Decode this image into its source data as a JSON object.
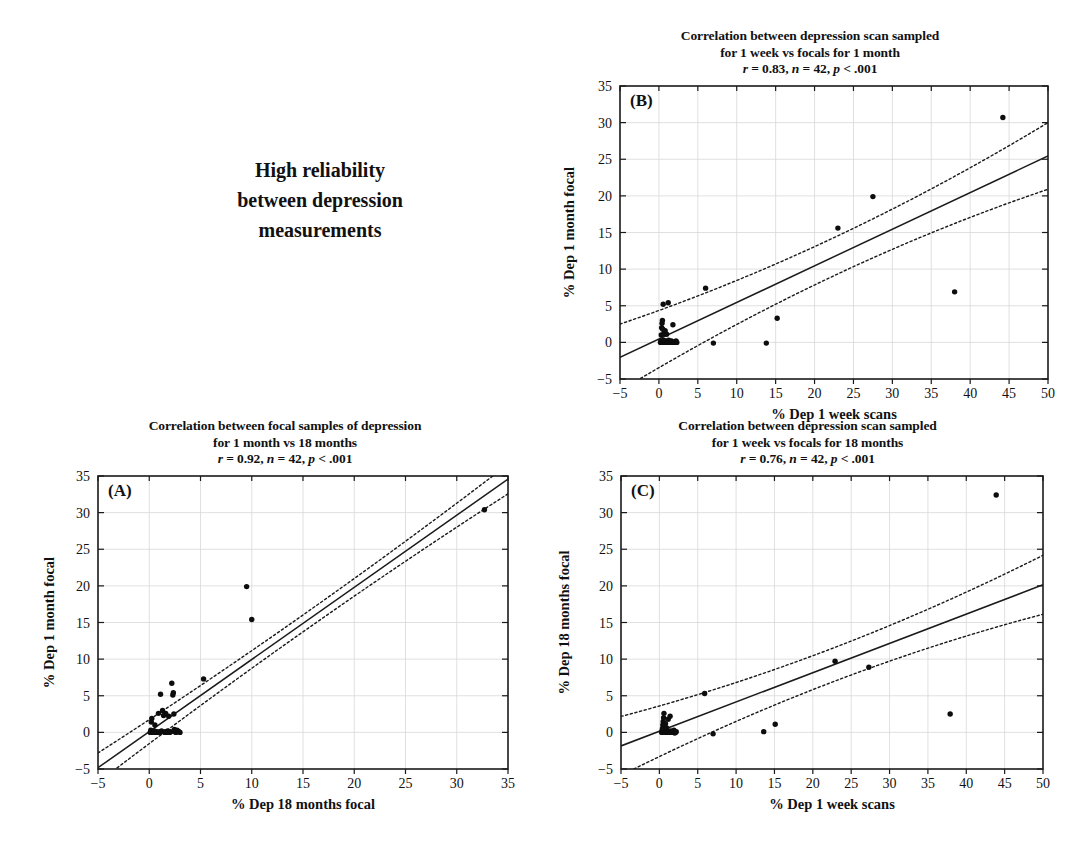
{
  "caption": {
    "lines": [
      "High reliability",
      "between depression",
      "measurements"
    ]
  },
  "chart_data": [
    {
      "id": "A",
      "panel_label": "(A)",
      "type": "scatter",
      "title_lines": [
        "Correlation between focal samples of depression",
        "for 1 month vs 18 months"
      ],
      "stats": {
        "r": "0.92",
        "n": "42",
        "p": "< .001",
        "text": "r = 0.92, n = 42, p < .001"
      },
      "xlabel": "% Dep 18 months focal",
      "ylabel": "% Dep 1 month focal",
      "xlim": [
        -5,
        35
      ],
      "ylim": [
        -5,
        35
      ],
      "xticks": [
        -5,
        0,
        5,
        10,
        15,
        20,
        25,
        30,
        35
      ],
      "yticks": [
        -5,
        0,
        5,
        10,
        15,
        20,
        25,
        30,
        35
      ],
      "xticklabels": [
        "−5",
        "0",
        "5",
        "10",
        "15",
        "20",
        "25",
        "30",
        "35"
      ],
      "yticklabels": [
        "−5",
        "0",
        "5",
        "10",
        "15",
        "20",
        "25",
        "30",
        "35"
      ],
      "grid": true,
      "fit": {
        "slope": 0.985,
        "intercept": 0.1
      },
      "ci_offset": 1.15,
      "points": [
        [
          0.1,
          0.0
        ],
        [
          0.15,
          0.3
        ],
        [
          0.2,
          1.4
        ],
        [
          0.25,
          1.9
        ],
        [
          0.3,
          0.0
        ],
        [
          0.35,
          0.1
        ],
        [
          0.4,
          0.0
        ],
        [
          0.5,
          0.2
        ],
        [
          0.55,
          1.0
        ],
        [
          0.6,
          0.0
        ],
        [
          0.7,
          0.1
        ],
        [
          0.8,
          0.0
        ],
        [
          0.9,
          2.6
        ],
        [
          1.0,
          0.1
        ],
        [
          1.05,
          0.0
        ],
        [
          1.1,
          5.2
        ],
        [
          1.2,
          0.2
        ],
        [
          1.3,
          3.0
        ],
        [
          1.4,
          2.3
        ],
        [
          1.5,
          0.0
        ],
        [
          1.55,
          0.1
        ],
        [
          1.6,
          2.6
        ],
        [
          1.7,
          0.0
        ],
        [
          1.8,
          0.2
        ],
        [
          1.9,
          2.2
        ],
        [
          2.0,
          0.0
        ],
        [
          2.1,
          0.1
        ],
        [
          2.2,
          6.7
        ],
        [
          2.3,
          5.1
        ],
        [
          2.35,
          5.4
        ],
        [
          2.4,
          2.5
        ],
        [
          2.5,
          0.1
        ],
        [
          2.6,
          0.0
        ],
        [
          2.7,
          0.3
        ],
        [
          2.8,
          0.2
        ],
        [
          2.9,
          0.1
        ],
        [
          3.0,
          0.0
        ],
        [
          5.3,
          7.3
        ],
        [
          9.5,
          19.9
        ],
        [
          10.0,
          15.4
        ],
        [
          32.7,
          30.4
        ],
        [
          2.45,
          0.4
        ]
      ]
    },
    {
      "id": "B",
      "panel_label": "(B)",
      "type": "scatter",
      "title_lines": [
        "Correlation between depression scan sampled",
        "for 1 week vs focals for 1 month"
      ],
      "stats": {
        "r": "0.83",
        "n": "42",
        "p": "< .001",
        "text": "r = 0.83, n = 42, p < .001"
      },
      "xlabel": "% Dep 1 week scans",
      "ylabel": "% Dep 1 month focal",
      "xlim": [
        -5,
        50
      ],
      "ylim": [
        -5,
        35
      ],
      "xticks": [
        -5,
        0,
        5,
        10,
        15,
        20,
        25,
        30,
        35,
        40,
        45,
        50
      ],
      "yticks": [
        -5,
        0,
        5,
        10,
        15,
        20,
        25,
        30,
        35
      ],
      "xticklabels": [
        "−5",
        "0",
        "5",
        "10",
        "15",
        "20",
        "25",
        "30",
        "35",
        "40",
        "45",
        "50"
      ],
      "yticklabels": [
        "−5",
        "0",
        "5",
        "10",
        "15",
        "20",
        "25",
        "30",
        "35"
      ],
      "grid": true,
      "fit": {
        "slope": 0.5,
        "intercept": 0.45
      },
      "ci_offset": 2.6,
      "points": [
        [
          0.2,
          0.0
        ],
        [
          0.25,
          0.2
        ],
        [
          0.3,
          1.0
        ],
        [
          0.35,
          2.0
        ],
        [
          0.4,
          2.6
        ],
        [
          0.45,
          0.1
        ],
        [
          0.5,
          0.0
        ],
        [
          0.55,
          5.2
        ],
        [
          0.6,
          0.3
        ],
        [
          0.65,
          1.2
        ],
        [
          0.7,
          0.0
        ],
        [
          0.75,
          0.1
        ],
        [
          0.8,
          1.6
        ],
        [
          0.85,
          0.0
        ],
        [
          0.9,
          0.2
        ],
        [
          0.95,
          0.0
        ],
        [
          1.0,
          1.1
        ],
        [
          1.05,
          0.0
        ],
        [
          1.1,
          0.1
        ],
        [
          1.15,
          0.0
        ],
        [
          1.2,
          5.4
        ],
        [
          1.25,
          0.3
        ],
        [
          1.3,
          0.0
        ],
        [
          1.4,
          0.1
        ],
        [
          1.5,
          0.0
        ],
        [
          1.6,
          0.2
        ],
        [
          1.7,
          0.0
        ],
        [
          1.8,
          2.4
        ],
        [
          1.9,
          0.0
        ],
        [
          2.0,
          0.1
        ],
        [
          2.1,
          0.0
        ],
        [
          2.2,
          0.2
        ],
        [
          2.3,
          0.0
        ],
        [
          0.45,
          3.0
        ],
        [
          0.5,
          1.8
        ],
        [
          6.0,
          7.4
        ],
        [
          7.0,
          -0.1
        ],
        [
          13.8,
          -0.1
        ],
        [
          15.2,
          3.3
        ],
        [
          23.0,
          15.6
        ],
        [
          27.5,
          19.9
        ],
        [
          38.0,
          6.9
        ],
        [
          44.2,
          30.7
        ]
      ]
    },
    {
      "id": "C",
      "panel_label": "(C)",
      "type": "scatter",
      "title_lines": [
        "Correlation between depression scan sampled",
        "for 1 week vs focals for 18 months"
      ],
      "stats": {
        "r": "0.76",
        "n": "42",
        "p": "< .001",
        "text": "r = 0.76, n = 42, p < .001"
      },
      "xlabel": "% Dep 1 week scans",
      "ylabel": "% Dep 18 months focal",
      "xlim": [
        -5,
        50
      ],
      "ylim": [
        -5,
        35
      ],
      "xticks": [
        -5,
        0,
        5,
        10,
        15,
        20,
        25,
        30,
        35,
        40,
        45,
        50
      ],
      "yticks": [
        -5,
        0,
        5,
        10,
        15,
        20,
        25,
        30,
        35
      ],
      "xticklabels": [
        "−5",
        "0",
        "5",
        "10",
        "15",
        "20",
        "25",
        "30",
        "35",
        "40",
        "45",
        "50"
      ],
      "yticklabels": [
        "−5",
        "0",
        "5",
        "10",
        "15",
        "20",
        "25",
        "30",
        "35"
      ],
      "grid": true,
      "fit": {
        "slope": 0.4,
        "intercept": 0.15
      },
      "ci_offset": 2.3,
      "points": [
        [
          0.3,
          0.0
        ],
        [
          0.35,
          0.2
        ],
        [
          0.4,
          0.5
        ],
        [
          0.45,
          1.0
        ],
        [
          0.5,
          1.5
        ],
        [
          0.55,
          2.0
        ],
        [
          0.6,
          2.6
        ],
        [
          0.62,
          0.1
        ],
        [
          0.65,
          0.0
        ],
        [
          0.7,
          0.3
        ],
        [
          0.72,
          0.8
        ],
        [
          0.75,
          0.0
        ],
        [
          0.8,
          1.2
        ],
        [
          0.85,
          0.0
        ],
        [
          0.9,
          0.1
        ],
        [
          0.95,
          0.6
        ],
        [
          1.0,
          0.0
        ],
        [
          1.05,
          0.2
        ],
        [
          1.1,
          0.0
        ],
        [
          1.15,
          1.8
        ],
        [
          1.2,
          0.0
        ],
        [
          1.25,
          0.1
        ],
        [
          1.3,
          0.0
        ],
        [
          1.4,
          2.2
        ],
        [
          1.5,
          0.2
        ],
        [
          1.6,
          0.0
        ],
        [
          1.7,
          0.1
        ],
        [
          1.8,
          0.0
        ],
        [
          1.9,
          0.3
        ],
        [
          2.0,
          -0.1
        ],
        [
          2.1,
          0.0
        ],
        [
          2.2,
          0.1
        ],
        [
          0.55,
          0.0
        ],
        [
          0.58,
          0.4
        ],
        [
          5.9,
          5.3
        ],
        [
          7.0,
          -0.2
        ],
        [
          13.6,
          0.1
        ],
        [
          15.1,
          1.1
        ],
        [
          22.9,
          9.7
        ],
        [
          27.3,
          8.9
        ],
        [
          37.9,
          2.5
        ],
        [
          43.9,
          32.4
        ]
      ]
    }
  ]
}
